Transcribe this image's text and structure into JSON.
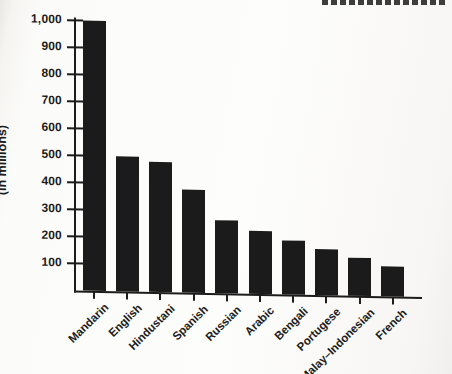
{
  "page": {
    "background_color": "#fbfbf9",
    "cropped_heading_visible": true
  },
  "chart_data": {
    "type": "bar",
    "title": "",
    "xlabel": "",
    "ylabel": "(in millions)",
    "categories": [
      "Mandarin",
      "English",
      "Hindustani",
      "Spanish",
      "Russian",
      "Arabic",
      "Bengali",
      "Portugese",
      "Malay–Indonesian",
      "French"
    ],
    "values": [
      1000,
      500,
      480,
      380,
      270,
      235,
      200,
      170,
      140,
      110
    ],
    "yticks": [
      100,
      200,
      300,
      400,
      500,
      600,
      700,
      800,
      900,
      1000
    ],
    "ytick_labels": [
      "100",
      "200",
      "300",
      "400",
      "500",
      "600",
      "700",
      "800",
      "900",
      "1,000"
    ],
    "ylim": [
      0,
      1000
    ],
    "grid": false,
    "legend": null,
    "bar_color": "#1b1b1b",
    "axis_color": "#1c1c1c",
    "x_labels_rotation_deg": -45
  }
}
